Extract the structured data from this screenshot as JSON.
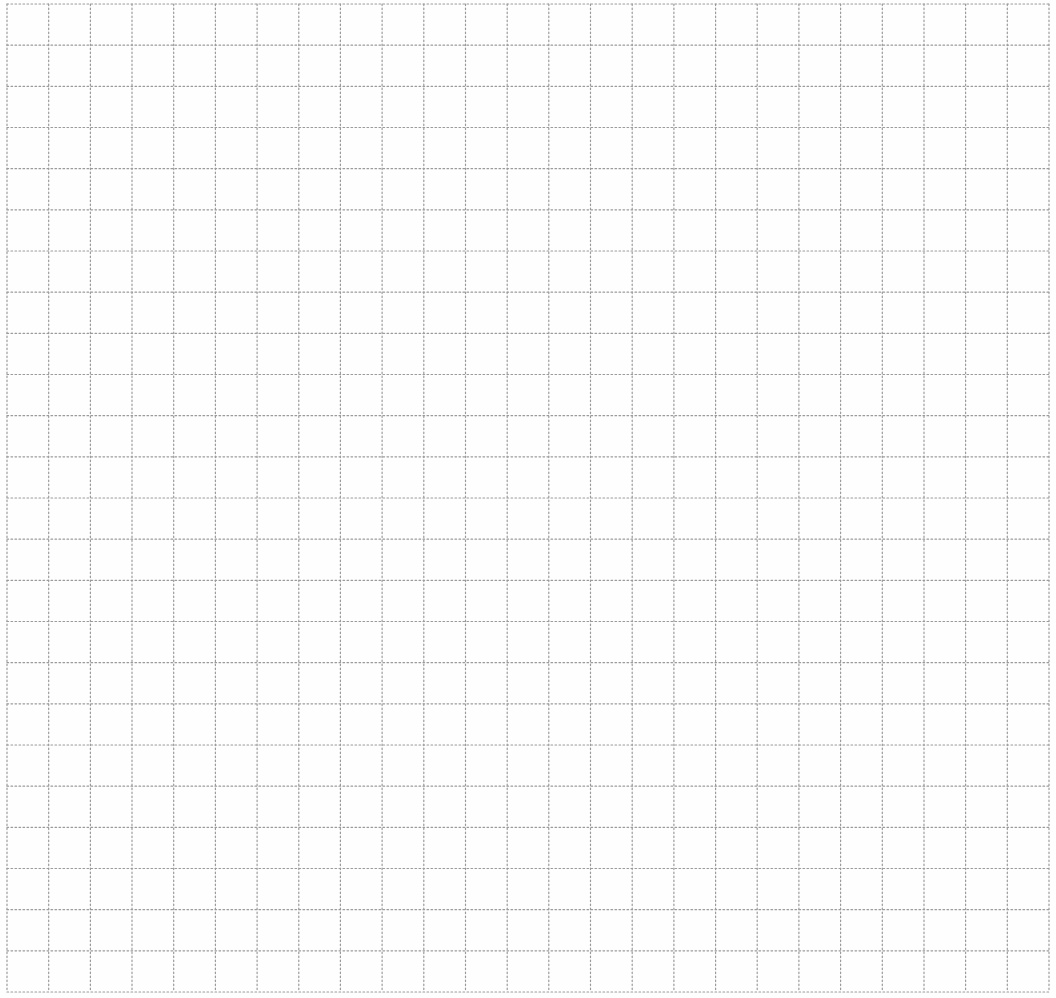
{
  "paper": {
    "background": "#fefefe",
    "line_color": "#9a9a9a",
    "line_width": 1.2,
    "dash": "1.6 2.4",
    "width": 1056,
    "height": 998
  },
  "grid": {
    "x_start": 7,
    "x_end": 1049,
    "columns": 25,
    "y_start": 4,
    "y_end": 992,
    "rows": 24
  }
}
